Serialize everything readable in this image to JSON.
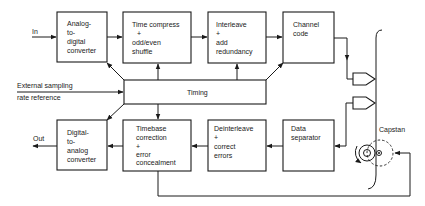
{
  "diagram": {
    "type": "block-diagram",
    "colors": {
      "ink": "#1a1a1a",
      "background": "#ffffff"
    },
    "inputs": {
      "in_label": "In",
      "out_label": "Out"
    },
    "external_reference": {
      "line1": "External sampling",
      "line2": "rate reference"
    },
    "record_chain": [
      {
        "id": "adc",
        "lines": [
          "Analog-",
          "to-",
          "digital",
          "converter"
        ]
      },
      {
        "id": "time_compress",
        "lines": [
          "Time compress",
          "+",
          "odd/even",
          "shuffle"
        ]
      },
      {
        "id": "interleave",
        "lines": [
          "Interleave",
          "+",
          "add",
          "redundancy"
        ]
      },
      {
        "id": "channel_code",
        "lines": [
          "Channel",
          "code"
        ]
      }
    ],
    "timing": {
      "label": "Timing"
    },
    "playback_chain": [
      {
        "id": "dac",
        "lines": [
          "Digital-",
          "to-",
          "analog",
          "converter"
        ]
      },
      {
        "id": "timebase",
        "lines": [
          "Timebase",
          "correction",
          "+",
          "error",
          "concealment"
        ]
      },
      {
        "id": "deinterleave",
        "lines": [
          "Deinterleave",
          "+",
          "correct",
          "errors"
        ]
      },
      {
        "id": "data_separator",
        "lines": [
          "Data",
          "separator"
        ]
      }
    ],
    "transport": {
      "capstan_label": "Capstan"
    }
  }
}
